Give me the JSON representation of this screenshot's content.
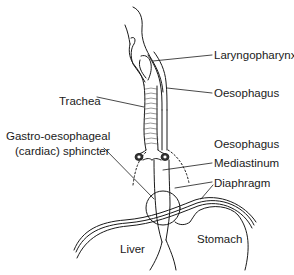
{
  "diagram": {
    "labels": {
      "laryngopharynx": "Laryngopharynx",
      "oesophagus_upper": "Oesophagus",
      "trachea": "Trachea",
      "sphincter_line1": "Gastro-oesophageal",
      "sphincter_line2": "(cardiac) sphincter",
      "oesophagus_lower": "Oesophagus",
      "mediastinum": "Mediastinum",
      "diaphragm": "Diaphragm",
      "liver": "Liver",
      "stomach": "Stomach"
    },
    "colors": {
      "line": "#1a1a1a",
      "background": "#ffffff"
    }
  }
}
